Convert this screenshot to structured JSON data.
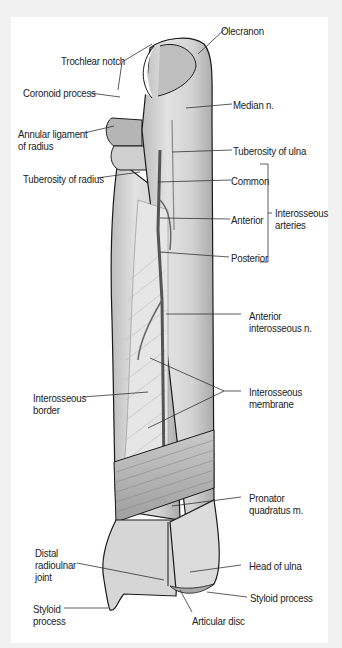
{
  "figure": {
    "labels": {
      "trochlear_notch": "Trochlear notch",
      "coronoid_process": "Coronoid process",
      "annular_ligament": [
        "Annular ligament",
        "of radius"
      ],
      "tuberosity_radius": "Tuberosity of radius",
      "olecranon": "Olecranon",
      "median_n": "Median n.",
      "tuberosity_ulna": "Tuberosity of ulna",
      "common": "Common",
      "anterior": "Anterior",
      "posterior": "Posterior",
      "interosseous_arteries": [
        "Interosseous",
        "arteries"
      ],
      "anterior_interosseous_n": [
        "Anterior",
        "interosseous n."
      ],
      "interosseous_membrane": [
        "Interosseous",
        "membrane"
      ],
      "interosseous_border": [
        "Interosseous",
        "border"
      ],
      "pronator_quadratus": [
        "Pronator",
        "quadratus m."
      ],
      "distal_radioulnar_joint": [
        "Distal",
        "radioulnar",
        "joint"
      ],
      "head_of_ulna": "Head of ulna",
      "styloid_process_ulna": "Styloid process",
      "styloid_process_radius": [
        "Styloid",
        "process"
      ],
      "articular_disc": "Articular disc"
    }
  },
  "colors": {
    "background": "#f1f1f1",
    "panel": "#ffffff",
    "bone": "#d9d9d9",
    "bone_shade": "#b8b8b8",
    "outline": "#1a1a1a",
    "artery": "#555555",
    "leader": "#333333"
  }
}
